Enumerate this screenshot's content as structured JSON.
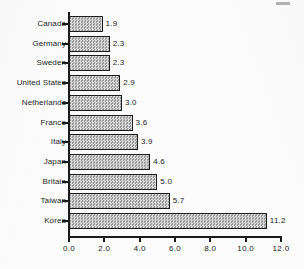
{
  "chart_data": {
    "type": "bar",
    "orientation": "horizontal",
    "title": "",
    "subtitle": "",
    "xlabel": "",
    "ylabel": "",
    "categories": [
      "Canada",
      "Germany",
      "Sweden",
      "United States",
      "Netherlands",
      "France",
      "Italy",
      "Japan",
      "Britain",
      "Taiwan",
      "Korea"
    ],
    "values": [
      1.9,
      2.3,
      2.3,
      2.9,
      3.0,
      3.6,
      3.9,
      4.6,
      5.0,
      5.7,
      11.2
    ],
    "data_labels": [
      "1.9",
      "2.3",
      "2.3",
      "2.9",
      "3.0",
      "3.6",
      "3.9",
      "4.6",
      "5.0",
      "5.7",
      "11.2"
    ],
    "xlim": [
      0.0,
      12.0
    ],
    "xticks": [
      0.0,
      2.0,
      4.0,
      6.0,
      8.0,
      10.0,
      12.0
    ],
    "xtick_labels": [
      "0.0",
      "2.0",
      "4.0",
      "6.0",
      "8.0",
      "10.0",
      "12.0"
    ],
    "grid": false,
    "legend": null,
    "bar_fill": "#b6b6b6",
    "bar_border": "#1c1c1c",
    "axis_color": "#1a1a1a",
    "background": "#fcfcfc"
  }
}
